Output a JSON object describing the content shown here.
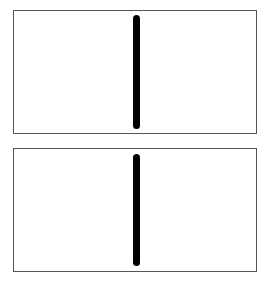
{
  "diagram": {
    "panels": [
      {
        "id": "top",
        "top": 10,
        "height": 124,
        "bar": {
          "top": 4,
          "height": 114,
          "color": "#000000"
        }
      },
      {
        "id": "bottom",
        "top": 148,
        "height": 124,
        "bar": {
          "top": 5,
          "height": 112,
          "color": "#000000"
        }
      }
    ],
    "border_color": "#555555",
    "background_color": "#ffffff"
  }
}
